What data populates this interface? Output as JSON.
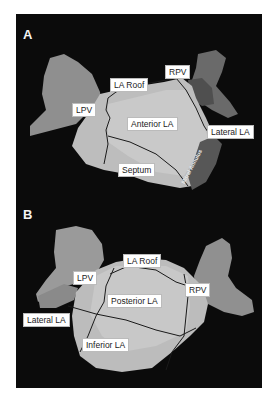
{
  "figure": {
    "panels": [
      {
        "letter": "A",
        "labels": {
          "la_roof": "LA Roof",
          "rpv": "RPV",
          "lpv": "LPV",
          "anterior_la": "Anterior LA",
          "lateral_la": "Lateral LA",
          "septum": "Septum",
          "mitral_annulus": "Mitral Annulus"
        }
      },
      {
        "letter": "B",
        "labels": {
          "la_roof": "LA Roof",
          "lpv": "LPV",
          "rpv": "RPV",
          "posterior_la": "Posterior LA",
          "lateral_la": "Lateral LA",
          "inferior_la": "Inferior LA"
        }
      }
    ],
    "colors": {
      "background": "#0b0b0b",
      "la_body": "#b9b9b9",
      "pv_light": "#8e8e8e",
      "pv_dark": "#5a5a5a",
      "mitral": "#505050",
      "boundary": "#1a1a1a"
    }
  }
}
